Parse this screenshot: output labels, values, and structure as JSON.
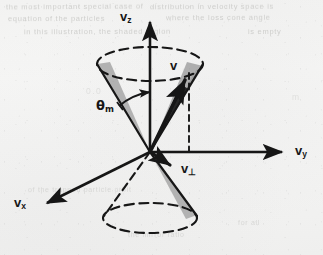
{
  "figure": {
    "name": "loss-cone-velocity-space-diagram",
    "kind": "scanned-textbook-line-drawing",
    "background_color": "#f4f4f3",
    "ink_color": "#161616",
    "shade_color": "#9a9a9a"
  },
  "labels": {
    "axis_z": {
      "symbol": "v",
      "subscript": "z"
    },
    "axis_y": {
      "symbol": "v",
      "subscript": "y"
    },
    "axis_x": {
      "symbol": "v",
      "subscript": "x"
    },
    "vector_v": {
      "symbol": "v",
      "subscript": ""
    },
    "vector_vperp": {
      "symbol": "v",
      "subscript": "⊥"
    },
    "angle_theta": {
      "symbol": "θ",
      "subscript": "m"
    }
  },
  "bleed_text": [
    {
      "text": "the most important special case of",
      "x": 6,
      "y": 2,
      "rot": -0.4
    },
    {
      "text": "distribution in velocity space is",
      "x": 150,
      "y": 2,
      "rot": -0.3
    },
    {
      "text": "equation of the particles",
      "x": 8,
      "y": 14,
      "rot": -0.2
    },
    {
      "text": "where the loss cone angle",
      "x": 166,
      "y": 13,
      "rot": -0.3
    },
    {
      "text": "in this illustration, the shaded region",
      "x": 24,
      "y": 27,
      "rot": -0.2
    },
    {
      "text": "is empty",
      "x": 248,
      "y": 27,
      "rot": -0.2
    },
    {
      "text": "0.0",
      "x": 86,
      "y": 86,
      "rot": 0,
      "cls": "b3"
    },
    {
      "text": "m",
      "x": 292,
      "y": 92,
      "rot": 0,
      "cls": "b3"
    },
    {
      "text": "of the trapped particle orbit",
      "x": 28,
      "y": 186,
      "rot": -0.2,
      "cls": "b2"
    },
    {
      "text": "for all",
      "x": 238,
      "y": 219,
      "rot": -0.2,
      "cls": "b2"
    },
    {
      "text": "the mirror ratio",
      "x": 128,
      "y": 231,
      "rot": -0.2,
      "cls": "b2"
    }
  ],
  "chart_data": {
    "type": "diagram",
    "origin": [
      150,
      152
    ],
    "axes": [
      {
        "name": "v_z",
        "from": [
          150,
          152
        ],
        "to": [
          150,
          18
        ],
        "style": "solid-arrow"
      },
      {
        "name": "v_y",
        "from": [
          150,
          152
        ],
        "to": [
          289,
          152
        ],
        "style": "solid-arrow"
      },
      {
        "name": "v_x",
        "from": [
          150,
          152
        ],
        "to": [
          41,
          206
        ],
        "style": "solid-arrow"
      }
    ],
    "cones": [
      {
        "name": "upper-loss-cone",
        "apex": [
          150,
          152
        ],
        "cap_center": [
          150,
          64
        ],
        "cap_rx": 53,
        "cap_ry": 17,
        "cap_style": "dashed-ellipse"
      },
      {
        "name": "lower-loss-cone",
        "apex": [
          150,
          152
        ],
        "cap_center": [
          150,
          218
        ],
        "cap_rx": 47,
        "cap_ry": 15,
        "cap_style": "dashed-ellipse"
      }
    ],
    "vectors": [
      {
        "name": "v",
        "from": [
          150,
          152
        ],
        "to": [
          189,
          73
        ],
        "style": "bold-solid-arrow"
      },
      {
        "name": "v_perp",
        "from": [
          150,
          152
        ],
        "to": [
          176,
          168
        ],
        "style": "bold-solid-arrow"
      },
      {
        "name": "drop-line",
        "from": [
          189,
          73
        ],
        "to": [
          189,
          152
        ],
        "style": "dashed"
      },
      {
        "name": "perp-line",
        "from": [
          150,
          152
        ],
        "to": [
          189,
          152
        ],
        "style": "solid"
      }
    ],
    "angle": {
      "name": "theta_m",
      "vertex": [
        150,
        152
      ],
      "between": [
        "v_z axis",
        "left cone edge"
      ],
      "arc_radius": 60,
      "label": "θ_m"
    }
  }
}
